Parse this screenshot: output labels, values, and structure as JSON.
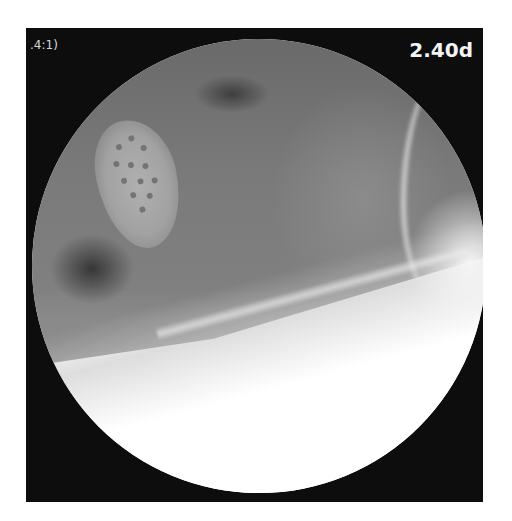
{
  "image": {
    "type": "fluoroscopy-xray",
    "overlay": {
      "top_left_text": ".4:1)",
      "top_right_text": "2.40d"
    },
    "colors": {
      "background": "#ffffff",
      "frame": "#0d0d0d",
      "overlay_text": "#f4f4f4"
    }
  }
}
